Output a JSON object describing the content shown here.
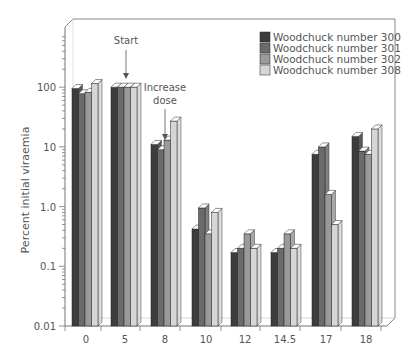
{
  "chart_data": {
    "type": "bar",
    "subtype": "3d-grouped-bar-log-scale",
    "title": "",
    "xlabel": "",
    "ylabel": "Percent initial viraemia",
    "yscale": "log",
    "ylim": [
      0.01,
      1000
    ],
    "yticks": [
      {
        "value": 0.01,
        "label": "0.01"
      },
      {
        "value": 0.1,
        "label": "0.1"
      },
      {
        "value": 1,
        "label": "1.0"
      },
      {
        "value": 10,
        "label": "10"
      },
      {
        "value": 100,
        "label": "100"
      }
    ],
    "categories": [
      "0",
      "5",
      "8",
      "10",
      "12",
      "14.5",
      "17",
      "18"
    ],
    "series": [
      {
        "name": "Woodchuck number 300",
        "color": "#3d3d3d",
        "values": [
          95,
          100,
          11,
          0.42,
          0.17,
          0.17,
          7.5,
          15
        ]
      },
      {
        "name": "Woodchuck number 301",
        "color": "#6b6b6b",
        "values": [
          78,
          100,
          9,
          0.95,
          0.2,
          0.2,
          10,
          8.5
        ]
      },
      {
        "name": "Woodchuck number 302",
        "color": "#9a9a9a",
        "values": [
          82,
          100,
          13,
          0.35,
          0.35,
          0.35,
          1.6,
          7.5
        ]
      },
      {
        "name": "Woodchuck number 308",
        "color": "#d6d6d6",
        "values": [
          115,
          100,
          27,
          0.8,
          0.2,
          0.2,
          0.5,
          20
        ]
      }
    ],
    "legend_position": "top-right",
    "grid": false,
    "annotations": [
      {
        "text": "Start",
        "category": "5"
      },
      {
        "text": "Increase dose",
        "category": "8"
      }
    ]
  },
  "legend": {
    "items": [
      {
        "label": "Woodchuck number 300",
        "color": "#3d3d3d"
      },
      {
        "label": "Woodchuck number 301",
        "color": "#6b6b6b"
      },
      {
        "label": "Woodchuck number 302",
        "color": "#9a9a9a"
      },
      {
        "label": "Woodchuck number 308",
        "color": "#d6d6d6"
      }
    ]
  },
  "annotations": {
    "start": "Start",
    "increase_line1": "Increase",
    "increase_line2": "dose"
  }
}
